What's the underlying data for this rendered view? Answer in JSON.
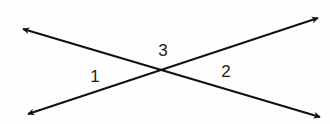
{
  "diagram": {
    "type": "intersecting-lines",
    "stroke_color": "#111111",
    "background_color": "#fefefe",
    "intersection": {
      "x": 164,
      "y": 69
    },
    "lines": [
      {
        "name": "line-a",
        "start": {
          "x": 23,
          "y": 29
        },
        "end": {
          "x": 320,
          "y": 117
        },
        "arrows": "both"
      },
      {
        "name": "line-b",
        "start": {
          "x": 28,
          "y": 114
        },
        "end": {
          "x": 318,
          "y": 18
        },
        "arrows": "both"
      }
    ],
    "angles": [
      {
        "label": "1",
        "x": 95,
        "y": 82
      },
      {
        "label": "2",
        "x": 226,
        "y": 77
      },
      {
        "label": "3",
        "x": 163,
        "y": 56
      }
    ]
  }
}
